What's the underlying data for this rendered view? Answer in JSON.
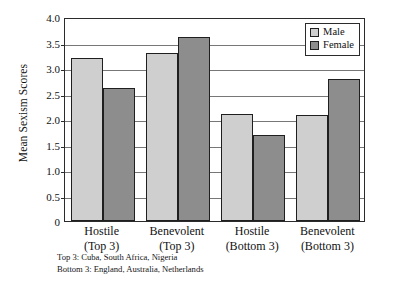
{
  "chart_data": {
    "type": "bar",
    "title": "",
    "xlabel": "",
    "ylabel": "Mean Sexism Scores",
    "ylim": [
      0,
      4.0
    ],
    "ytick_values": [
      0,
      0.5,
      1.0,
      1.5,
      2.0,
      2.5,
      3.0,
      3.5,
      4.0
    ],
    "ytick_labels": [
      "0",
      "0.5",
      "1.0",
      "1.5",
      "2.0",
      "2.5",
      "3.0",
      "3.5",
      "4.0"
    ],
    "grid": "horizontal",
    "legend_position": "top-right",
    "categories": [
      "Hostile (Top 3)",
      "Benevolent (Top 3)",
      "Hostile (Bottom 3)",
      "Benevolent (Bottom 3)"
    ],
    "category_lines": [
      [
        "Hostile",
        "(Top 3)"
      ],
      [
        "Benevolent",
        "(Top 3)"
      ],
      [
        "Hostile",
        "(Bottom 3)"
      ],
      [
        "Benevolent",
        "(Bottom 3)"
      ]
    ],
    "series": [
      {
        "name": "Male",
        "color": "#cfcfcf",
        "values": [
          3.2,
          3.3,
          2.1,
          2.08
        ]
      },
      {
        "name": "Female",
        "color": "#8d8d8d",
        "values": [
          2.6,
          3.6,
          1.68,
          2.78
        ]
      }
    ],
    "annotations": [
      "Top 3: Cuba, South Africa, Nigeria",
      "Bottom 3: England, Australia, Netherlands"
    ]
  },
  "legend": {
    "items": [
      {
        "label": "Male"
      },
      {
        "label": "Female"
      }
    ]
  },
  "footnotes": {
    "line1": "Top 3: Cuba, South Africa, Nigeria",
    "line2": "Bottom 3: England, Australia, Netherlands"
  }
}
